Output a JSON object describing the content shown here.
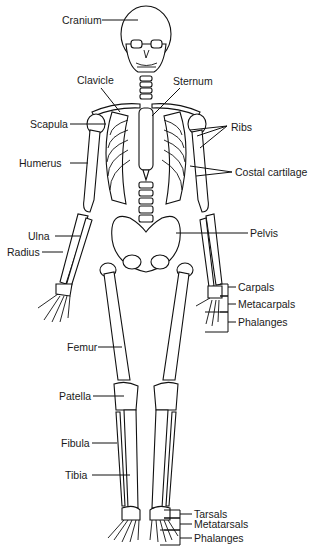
{
  "diagram": {
    "labels": {
      "cranium": "Cranium",
      "clavicle": "Clavicle",
      "sternum": "Sternum",
      "scapula": "Scapula",
      "ribs": "Ribs",
      "humerus": "Humerus",
      "costal_cartilage": "Costal cartilage",
      "ulna": "Ulna",
      "radius": "Radius",
      "pelvis": "Pelvis",
      "carpals": "Carpals",
      "metacarpals": "Metacarpals",
      "phalanges_hand": "Phalanges",
      "femur": "Femur",
      "patella": "Patella",
      "fibula": "Fibula",
      "tibia": "Tibia",
      "tarsals": "Tarsals",
      "metatarsals": "Metatarsals",
      "phalanges_foot": "Phalanges"
    }
  }
}
